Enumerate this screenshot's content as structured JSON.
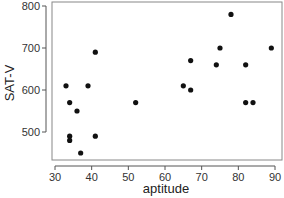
{
  "chart_data": {
    "type": "scatter",
    "title": "",
    "xlabel": "aptitude",
    "ylabel": "SAT-V",
    "xlim": [
      28,
      92
    ],
    "ylim": [
      430,
      810
    ],
    "xticks": [
      30,
      40,
      50,
      60,
      70,
      80,
      90
    ],
    "yticks": [
      500,
      600,
      700,
      800
    ],
    "grid": false,
    "legend": null,
    "marker_color": "#111111",
    "points": [
      {
        "x": 33,
        "y": 610
      },
      {
        "x": 39,
        "y": 610
      },
      {
        "x": 41,
        "y": 690
      },
      {
        "x": 34,
        "y": 570
      },
      {
        "x": 36,
        "y": 550
      },
      {
        "x": 34,
        "y": 490
      },
      {
        "x": 34,
        "y": 480
      },
      {
        "x": 41,
        "y": 490
      },
      {
        "x": 37,
        "y": 450
      },
      {
        "x": 52,
        "y": 570
      },
      {
        "x": 65,
        "y": 610
      },
      {
        "x": 67,
        "y": 600
      },
      {
        "x": 67,
        "y": 670
      },
      {
        "x": 74,
        "y": 660
      },
      {
        "x": 75,
        "y": 700
      },
      {
        "x": 78,
        "y": 780
      },
      {
        "x": 82,
        "y": 660
      },
      {
        "x": 82,
        "y": 570
      },
      {
        "x": 84,
        "y": 570
      },
      {
        "x": 89,
        "y": 700
      }
    ]
  }
}
